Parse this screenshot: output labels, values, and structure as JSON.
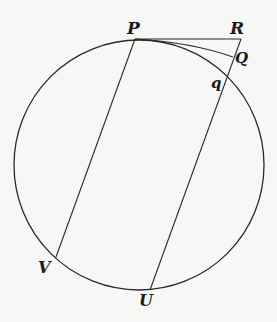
{
  "diagram": {
    "type": "geometry",
    "circle": {
      "cx": 139,
      "cy": 165,
      "r": 125
    },
    "points": {
      "P": {
        "x": 135,
        "y": 39,
        "label": "P"
      },
      "R": {
        "x": 241,
        "y": 39,
        "label": "R"
      },
      "Q": {
        "x": 233,
        "y": 57,
        "label": "Q"
      },
      "q": {
        "x": 225,
        "y": 77,
        "label": "q"
      },
      "V": {
        "x": 56,
        "y": 257,
        "label": "V"
      },
      "U": {
        "x": 150,
        "y": 290,
        "label": "U"
      }
    },
    "segments": [
      {
        "from": "P",
        "to": "R",
        "name": "tangent-PR"
      },
      {
        "from": "P",
        "to": "Q",
        "name": "chord-PQ"
      },
      {
        "from": "P",
        "to": "V",
        "name": "chord-PV"
      },
      {
        "from": "R",
        "to": "U",
        "name": "line-RU"
      }
    ],
    "labels": {
      "P": "P",
      "R": "R",
      "Q": "Q",
      "q": "q",
      "V": "V",
      "U": "U"
    },
    "colors": {
      "stroke": "#2a2a2a",
      "background": "#f7f7f5"
    }
  }
}
